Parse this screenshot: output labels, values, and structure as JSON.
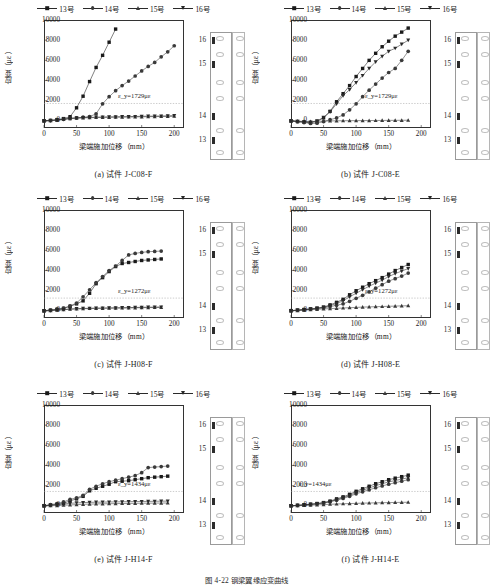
{
  "figure": {
    "caption": "图 4-22  钢梁翼缘应变曲线",
    "axis": {
      "xlabel": "梁端施加位移（mm）",
      "ylabel": "应变（με）",
      "xticks": [
        "0",
        "50",
        "100",
        "150",
        "200"
      ],
      "yticks": [
        "0",
        "2000",
        "4000",
        "6000",
        "8000",
        "10000"
      ],
      "xlim": [
        0,
        215
      ],
      "ylim": [
        -700,
        10000
      ]
    },
    "legend": [
      {
        "label": "13号",
        "marker": "square",
        "color": "#1a1a1a"
      },
      {
        "label": "14号",
        "marker": "circle",
        "color": "#3a3a3a"
      },
      {
        "label": "15号",
        "marker": "triangle-up",
        "color": "#3a3a3a"
      },
      {
        "label": "16号",
        "marker": "triangle-down",
        "color": "#2a2a2a"
      }
    ],
    "inset_gauges": [
      "16",
      "15",
      "14",
      "13"
    ]
  },
  "chart_data": [
    {
      "id": "a",
      "type": "line",
      "title": "(a) 试件 J-C08-F",
      "xlabel": "梁端施加位移（mm）",
      "ylabel": "应变（με）",
      "xlim": [
        0,
        215
      ],
      "ylim": [
        -700,
        10000
      ],
      "grid": false,
      "annotation": "ε_y=1729με",
      "yield_strain": 1729,
      "x": [
        0,
        10,
        20,
        30,
        40,
        50,
        60,
        70,
        80,
        90,
        100,
        110,
        120,
        130,
        140,
        150,
        160,
        170,
        180,
        190,
        200
      ],
      "series": [
        {
          "name": "13号",
          "marker": "square",
          "values": [
            20,
            60,
            130,
            230,
            420,
            1300,
            2450,
            3900,
            5300,
            6500,
            7800,
            9100,
            null,
            null,
            null,
            null,
            null,
            null,
            null,
            null,
            null
          ]
        },
        {
          "name": "14号",
          "marker": "circle",
          "values": [
            10,
            40,
            90,
            160,
            250,
            300,
            370,
            430,
            700,
            1700,
            2400,
            3000,
            3500,
            3950,
            4450,
            4950,
            5400,
            5800,
            6350,
            6850,
            7450
          ]
        },
        {
          "name": "15号",
          "marker": "triangle-up",
          "values": [
            5,
            30,
            80,
            150,
            230,
            280,
            300,
            320,
            340,
            350,
            360,
            370,
            380,
            390,
            400,
            410,
            420,
            430,
            440,
            450,
            470
          ]
        },
        {
          "name": "16号",
          "marker": "triangle-down",
          "values": [
            8,
            35,
            90,
            170,
            260,
            300,
            330,
            350,
            370,
            390,
            400,
            410,
            420,
            430,
            440,
            460,
            470,
            480,
            490,
            500,
            520
          ]
        }
      ]
    },
    {
      "id": "b",
      "type": "line",
      "title": "(b) 试件 J-C08-E",
      "xlabel": "梁端施加位移（mm）",
      "ylabel": "应变（με）",
      "xlim": [
        0,
        215
      ],
      "ylim": [
        -700,
        10000
      ],
      "grid": false,
      "annotation": "ε_y=1729με",
      "yield_strain": 1729,
      "x": [
        0,
        10,
        20,
        30,
        40,
        50,
        60,
        70,
        80,
        90,
        100,
        110,
        120,
        130,
        140,
        150,
        160,
        170,
        180
      ],
      "series": [
        {
          "name": "13号",
          "marker": "square",
          "values": [
            0,
            -60,
            -120,
            -180,
            -60,
            300,
            950,
            1900,
            2700,
            3500,
            4400,
            5200,
            6000,
            6700,
            7350,
            7900,
            8400,
            8800,
            9200
          ]
        },
        {
          "name": "14号",
          "marker": "circle",
          "values": [
            0,
            -80,
            -160,
            -250,
            -230,
            -60,
            120,
            300,
            600,
            1100,
            1700,
            2400,
            3050,
            3650,
            4250,
            4800,
            5200,
            6000,
            6900
          ]
        },
        {
          "name": "15号",
          "marker": "triangle-up",
          "values": [
            0,
            -20,
            -40,
            -60,
            -40,
            -20,
            0,
            10,
            20,
            25,
            30,
            35,
            40,
            45,
            50,
            55,
            60,
            65,
            70
          ]
        },
        {
          "name": "16号",
          "marker": "triangle-down",
          "values": [
            0,
            -40,
            -80,
            -120,
            0,
            350,
            900,
            1700,
            2500,
            3100,
            3800,
            4500,
            5200,
            5850,
            6400,
            6900,
            7200,
            7600,
            8000
          ]
        }
      ]
    },
    {
      "id": "c",
      "type": "line",
      "title": "(c) 试件 J-H08-F",
      "xlabel": "梁端施加位移（mm）",
      "ylabel": "应变（με）",
      "xlim": [
        0,
        215
      ],
      "ylim": [
        -700,
        10000
      ],
      "grid": false,
      "annotation": "ε_y=1272με",
      "yield_strain": 1272,
      "x": [
        0,
        10,
        20,
        30,
        40,
        50,
        60,
        70,
        80,
        90,
        100,
        110,
        120,
        130,
        140,
        150,
        160,
        170,
        180
      ],
      "series": [
        {
          "name": "13号",
          "marker": "square",
          "values": [
            20,
            80,
            160,
            250,
            450,
            700,
            1000,
            1750,
            2700,
            3300,
            3900,
            4400,
            4700,
            4800,
            4900,
            5000,
            5050,
            5100,
            5150
          ]
        },
        {
          "name": "14号",
          "marker": "circle",
          "values": [
            20,
            90,
            180,
            280,
            500,
            780,
            1400,
            2100,
            2800,
            3400,
            4000,
            4450,
            5000,
            5550,
            5700,
            5800,
            5870,
            5900,
            5930
          ]
        },
        {
          "name": "15号",
          "marker": "triangle-up",
          "values": [
            5,
            30,
            70,
            120,
            170,
            200,
            220,
            240,
            250,
            260,
            270,
            280,
            290,
            300,
            310,
            320,
            330,
            340,
            350
          ]
        },
        {
          "name": "16号",
          "marker": "triangle-down",
          "values": [
            8,
            40,
            85,
            140,
            190,
            220,
            245,
            265,
            280,
            290,
            300,
            310,
            320,
            330,
            345,
            360,
            370,
            380,
            390
          ]
        }
      ]
    },
    {
      "id": "d",
      "type": "line",
      "title": "(d) 试件 J-H08-E",
      "xlabel": "梁端施加位移（mm）",
      "ylabel": "应变（με）",
      "xlim": [
        0,
        215
      ],
      "ylim": [
        -700,
        10000
      ],
      "grid": false,
      "annotation": "ε_y=1272με",
      "yield_strain": 1272,
      "x": [
        0,
        10,
        20,
        30,
        40,
        50,
        60,
        70,
        80,
        90,
        100,
        110,
        120,
        130,
        140,
        150,
        160,
        170,
        180
      ],
      "series": [
        {
          "name": "13号",
          "marker": "square",
          "values": [
            30,
            80,
            140,
            200,
            280,
            380,
            600,
            850,
            1150,
            1600,
            2000,
            2350,
            2700,
            3000,
            3300,
            3650,
            4000,
            4300,
            4600
          ]
        },
        {
          "name": "14号",
          "marker": "circle",
          "values": [
            25,
            70,
            120,
            170,
            240,
            310,
            420,
            560,
            700,
            950,
            1250,
            1550,
            1900,
            2250,
            2600,
            2950,
            3200,
            3450,
            3750
          ]
        },
        {
          "name": "15号",
          "marker": "triangle-up",
          "values": [
            10,
            40,
            80,
            120,
            160,
            200,
            230,
            260,
            290,
            320,
            350,
            380,
            400,
            420,
            440,
            460,
            480,
            500,
            520
          ]
        },
        {
          "name": "16号",
          "marker": "triangle-down",
          "values": [
            28,
            75,
            130,
            185,
            260,
            350,
            520,
            740,
            1000,
            1400,
            1750,
            2100,
            2450,
            2750,
            3050,
            3400,
            3700,
            3950,
            4200
          ]
        }
      ]
    },
    {
      "id": "e",
      "type": "line",
      "title": "(e) 试件 J-H14-F",
      "xlabel": "梁端施加位移（mm）",
      "ylabel": "应变（με）",
      "xlim": [
        0,
        215
      ],
      "ylim": [
        -700,
        10000
      ],
      "grid": false,
      "annotation": "ε_y=1434με",
      "yield_strain": 1434,
      "x": [
        0,
        10,
        20,
        30,
        40,
        50,
        60,
        70,
        80,
        90,
        100,
        110,
        120,
        130,
        140,
        150,
        160,
        170,
        180,
        190
      ],
      "series": [
        {
          "name": "13号",
          "marker": "square",
          "values": [
            20,
            90,
            170,
            260,
            500,
            700,
            950,
            1500,
            1750,
            1950,
            2150,
            2400,
            2450,
            2500,
            2600,
            2700,
            2800,
            2850,
            2900,
            2950
          ]
        },
        {
          "name": "14号",
          "marker": "circle",
          "values": [
            25,
            120,
            240,
            400,
            650,
            800,
            1050,
            1650,
            1950,
            2200,
            2400,
            2550,
            2700,
            2850,
            3000,
            3300,
            3800,
            3850,
            3900,
            3950
          ]
        },
        {
          "name": "15号",
          "marker": "triangle-up",
          "values": [
            5,
            20,
            40,
            70,
            100,
            130,
            160,
            180,
            200,
            210,
            220,
            230,
            240,
            250,
            260,
            270,
            275,
            280,
            285,
            290
          ]
        },
        {
          "name": "16号",
          "marker": "triangle-down",
          "values": [
            10,
            60,
            120,
            190,
            260,
            300,
            330,
            350,
            370,
            380,
            390,
            400,
            410,
            420,
            430,
            440,
            450,
            460,
            470,
            480
          ]
        }
      ]
    },
    {
      "id": "f",
      "type": "line",
      "title": "(f) 试件 J-H14-E",
      "xlabel": "梁端施加位移（mm）",
      "ylabel": "应变（με）",
      "xlim": [
        0,
        215
      ],
      "ylim": [
        -700,
        10000
      ],
      "grid": false,
      "annotation": "ε_y=1434με",
      "yield_strain": 1434,
      "x": [
        0,
        10,
        20,
        30,
        40,
        50,
        60,
        70,
        80,
        90,
        100,
        110,
        120,
        130,
        140,
        150,
        160,
        170,
        180
      ],
      "series": [
        {
          "name": "13号",
          "marker": "square",
          "values": [
            20,
            60,
            110,
            170,
            240,
            330,
            480,
            700,
            900,
            1150,
            1450,
            1700,
            1950,
            2200,
            2400,
            2600,
            2750,
            2900,
            3050
          ]
        },
        {
          "name": "14号",
          "marker": "circle",
          "values": [
            15,
            50,
            95,
            145,
            205,
            280,
            400,
            560,
            740,
            950,
            1200,
            1400,
            1600,
            1800,
            1980,
            2150,
            2300,
            2450,
            2600
          ]
        },
        {
          "name": "15号",
          "marker": "triangle-up",
          "values": [
            5,
            20,
            45,
            75,
            105,
            135,
            165,
            190,
            215,
            235,
            255,
            275,
            290,
            305,
            320,
            330,
            345,
            355,
            365
          ]
        },
        {
          "name": "16号",
          "marker": "triangle-down",
          "values": [
            18,
            55,
            105,
            160,
            225,
            310,
            440,
            630,
            820,
            1050,
            1320,
            1550,
            1780,
            2000,
            2200,
            2380,
            2520,
            2650,
            2800
          ]
        }
      ]
    }
  ]
}
